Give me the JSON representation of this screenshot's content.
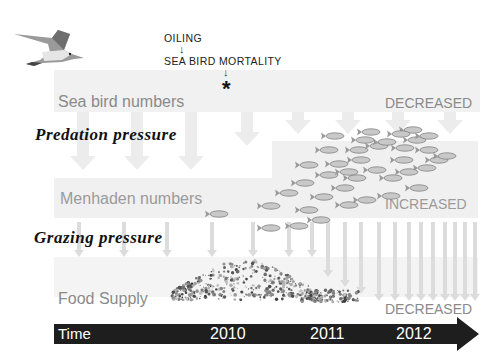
{
  "annotations": {
    "oiling": "OILING",
    "sea_bird_mortality": "SEA BIRD MORTALITY",
    "down_arrow": "↓",
    "impact_marker": "*"
  },
  "bands": {
    "sea_bird": {
      "label": "Sea bird numbers",
      "status": "DECREASED"
    },
    "menhaden": {
      "label": "Menhaden numbers",
      "status": "INCREASED"
    },
    "food": {
      "label": "Food Supply",
      "status": "DECREASED"
    }
  },
  "pressures": {
    "predation": "Predation pressure",
    "grazing": "Grazing pressure"
  },
  "timeline": {
    "label": "Time",
    "years": [
      "2010",
      "2011",
      "2012"
    ]
  },
  "icons": {
    "bird": "seagull-icon",
    "fish": "menhaden-fish-icon",
    "plankton": "plankton-cluster-icon"
  },
  "colors": {
    "band_bg": "#f1f1f1",
    "faded_text": "#8a8a8a",
    "timeline_bg": "#1e1e1e",
    "arrow": "#dcdcdc"
  }
}
